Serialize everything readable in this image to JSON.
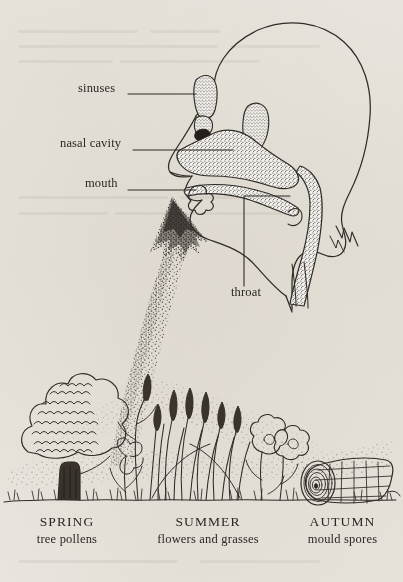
{
  "figure": {
    "background_color": "#f4f2ee",
    "ink_color": "#2a2724"
  },
  "anatomy_labels": [
    {
      "id": "sinuses",
      "text": "sinuses",
      "text_x": 78,
      "text_y": 89,
      "leader_from_x": 128,
      "leader_from_y": 94,
      "leader_to_x": 196,
      "leader_to_y": 94
    },
    {
      "id": "nasal-cavity",
      "text": "nasal cavity",
      "text_x": 60,
      "text_y": 144,
      "leader_from_x": 133,
      "leader_from_y": 150,
      "leader_to_x": 233,
      "leader_to_y": 150
    },
    {
      "id": "mouth",
      "text": "mouth",
      "text_x": 85,
      "text_y": 184,
      "leader_from_x": 128,
      "leader_from_y": 190,
      "leader_to_x": 196,
      "leader_to_y": 190
    },
    {
      "id": "throat",
      "text": "throat",
      "text_x": 231,
      "text_y": 293,
      "leader_from_x": 244,
      "leader_from_y": 286,
      "leader_to_x": 244,
      "leader_to_y": 196
    }
  ],
  "seasons": [
    {
      "id": "spring",
      "name": "SPRING",
      "allergen": "tree pollens",
      "source": "tree",
      "center_x": 67,
      "label_y": 521
    },
    {
      "id": "summer",
      "name": "SUMMER",
      "allergen": "flowers and grasses",
      "source": "flowers-and-grasses",
      "center_x": 208,
      "label_y": 521
    },
    {
      "id": "autumn",
      "name": "AUTUMN",
      "allergen": "mould spores",
      "source": "log",
      "center_x": 341,
      "label_y": 521
    }
  ],
  "scene": {
    "pollen_plume": "stippled cloud of airborne allergen particles rising from the ground vegetation into the nostril",
    "ground_line": "grass tufts along the base of the illustration"
  }
}
